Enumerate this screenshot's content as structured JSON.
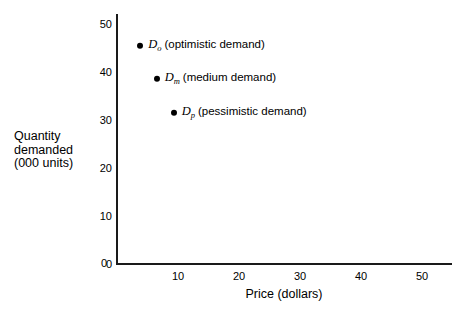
{
  "chart_data": {
    "type": "scatter",
    "title": "",
    "xlabel": "Price (dollars)",
    "ylabel": "Quantity\ndemanded\n(000 units)",
    "xlim": [
      0,
      55
    ],
    "ylim": [
      0,
      55
    ],
    "xticks": [
      "0",
      "10",
      "20",
      "30",
      "40",
      "50"
    ],
    "xtick_values": [
      0,
      10,
      20,
      30,
      40,
      50
    ],
    "yticks": [
      "0",
      "10",
      "20",
      "30",
      "40",
      "50"
    ],
    "ytick_values": [
      0,
      10,
      20,
      30,
      40,
      50
    ],
    "grid": false,
    "legend_position": "none",
    "marker_color": "#000000",
    "axis_color": "#1a1a1a",
    "points": [
      {
        "symbol": "D",
        "subscript": "o",
        "label": "(optimistic demand)",
        "x": 3.8,
        "y": 45.5
      },
      {
        "symbol": "D",
        "subscript": "m",
        "label": "(medium demand)",
        "x": 6.5,
        "y": 38.5
      },
      {
        "symbol": "D",
        "subscript": "p",
        "label": "(pessimistic demand)",
        "x": 9.3,
        "y": 31.5
      }
    ]
  }
}
